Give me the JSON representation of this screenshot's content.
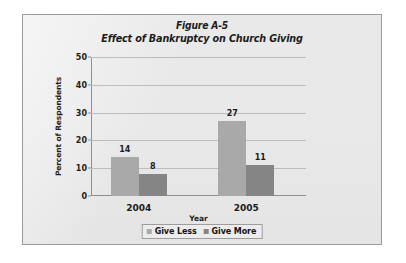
{
  "figure": {
    "title_line_1": "Figure A-5",
    "title_line_2": "Effect of Bankruptcy on Church Giving"
  },
  "colors": {
    "give_less": "#a9a9a9",
    "give_more": "#858585",
    "panel_background": "#e9e9e9",
    "panel_border": "#9a9a9a",
    "gridline": "#bdbdbd",
    "axis": "#8e8e8e",
    "text": "#1b1b1b"
  },
  "chart_data": {
    "type": "bar",
    "title": "Figure A-5 Effect of Bankruptcy on Church Giving",
    "xlabel": "Year",
    "ylabel": "Percent of Respondents",
    "categories": [
      "2004",
      "2005"
    ],
    "series": [
      {
        "name": "Give Less",
        "values": [
          14,
          27
        ],
        "color": "#a9a9a9"
      },
      {
        "name": "Give More",
        "values": [
          8,
          11
        ],
        "color": "#858585"
      }
    ],
    "ylim": [
      0,
      50
    ],
    "yticks": [
      0,
      10,
      20,
      30,
      40,
      50
    ],
    "ytick_labels": [
      "0",
      "10",
      "20",
      "30",
      "40",
      "50"
    ],
    "grid": true,
    "data_labels": [
      14,
      8,
      27,
      11
    ],
    "legend_position": "bottom"
  }
}
